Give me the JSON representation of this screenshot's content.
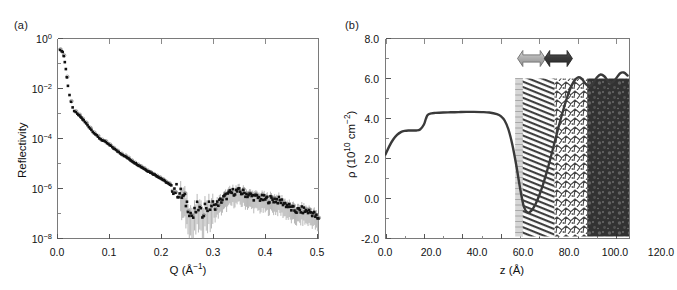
{
  "figure": {
    "panel_a_label": "(a)",
    "panel_b_label": "(b)"
  },
  "chart_data": [
    {
      "id": "panel-a",
      "type": "scatter",
      "title": "",
      "panel": "(a)",
      "xlabel": "Q (Å⁻¹)",
      "ylabel": "Reflectivity",
      "xlim": [
        0.0,
        0.5
      ],
      "ylim": [
        1e-08,
        3.0
      ],
      "yscale": "log",
      "xscale": "linear",
      "grid": false,
      "legend": "none",
      "xticks": [
        "0.0",
        "0.1",
        "0.2",
        "0.3",
        "0.4",
        "0.5"
      ],
      "xtick_values": [
        0.0,
        0.1,
        0.2,
        0.3,
        0.4,
        0.5
      ],
      "yticks": [
        "10⁰",
        "10⁻²",
        "10⁻⁴",
        "10⁻⁶",
        "10⁻⁸"
      ],
      "ytick_values": [
        1.0,
        0.01,
        0.0001,
        1e-06,
        1e-08
      ],
      "series": [
        {
          "name": "measured reflectivity",
          "marker": "filled-square",
          "color": "#111111",
          "errorbars": true,
          "x": [
            0.005,
            0.008,
            0.01,
            0.012,
            0.014,
            0.016,
            0.018,
            0.02,
            0.023,
            0.026,
            0.029,
            0.032,
            0.035,
            0.038,
            0.042,
            0.046,
            0.05,
            0.055,
            0.06,
            0.065,
            0.07,
            0.075,
            0.08,
            0.085,
            0.09,
            0.095,
            0.1,
            0.105,
            0.11,
            0.115,
            0.12,
            0.125,
            0.13,
            0.14,
            0.15,
            0.16,
            0.17,
            0.18,
            0.19,
            0.2,
            0.21,
            0.22,
            0.23,
            0.24,
            0.25,
            0.255,
            0.26,
            0.265,
            0.27,
            0.275,
            0.28,
            0.285,
            0.29,
            0.295,
            0.3,
            0.31,
            0.32,
            0.33,
            0.34,
            0.35,
            0.36,
            0.37,
            0.38,
            0.39,
            0.4,
            0.41,
            0.42,
            0.43,
            0.44,
            0.45,
            0.46,
            0.47,
            0.48,
            0.49,
            0.5
          ],
          "y": [
            0.95,
            0.9,
            0.8,
            0.55,
            0.3,
            0.15,
            0.07,
            0.03,
            0.012,
            0.006,
            0.0035,
            0.0026,
            0.0022,
            0.0019,
            0.0016,
            0.0013,
            0.001,
            0.00075,
            0.00055,
            0.0004,
            0.0003,
            0.00023,
            0.00018,
            0.00015,
            0.00013,
            0.00011,
            9e-05,
            7.5e-05,
            6e-05,
            5e-05,
            4.2e-05,
            3.5e-05,
            3e-05,
            2.1e-05,
            1.5e-05,
            1.1e-05,
            8e-06,
            6e-06,
            4.5e-06,
            3.3e-06,
            2.3e-06,
            1.6e-06,
            1e-06,
            6e-07,
            2.5e-07,
            1.2e-07,
            8e-08,
            1.5e-07,
            2.2e-07,
            1e-07,
            1.8e-07,
            2.5e-07,
            2e-07,
            2.6e-07,
            2.2e-07,
            3.5e-07,
            5.5e-07,
            8e-07,
            1e-06,
            9.5e-07,
            8e-07,
            6.5e-07,
            5.5e-07,
            5e-07,
            4.6e-07,
            4.6e-07,
            4.4e-07,
            3.6e-07,
            2.6e-07,
            1.7e-07,
            1.5e-07,
            1.6e-07,
            1.4e-07,
            1.2e-07,
            6e-08
          ]
        },
        {
          "name": "open-circle data / fit overlay",
          "marker": "open-circle",
          "color": "#8c8c8c",
          "errorbars": false
        }
      ],
      "annotations": []
    },
    {
      "id": "panel-b",
      "type": "line",
      "title": "",
      "panel": "(b)",
      "xlabel": "z (Å)",
      "ylabel": "ρ (10¹⁰ cm⁻²)",
      "xlim": [
        0.0,
        127.0
      ],
      "ylim": [
        -2.0,
        8.0
      ],
      "yscale": "linear",
      "xscale": "linear",
      "grid": false,
      "legend": "none",
      "xticks": [
        "0.0",
        "20.0",
        "40.0",
        "60.0",
        "80.0",
        "100.0",
        "120.0"
      ],
      "xtick_values": [
        0,
        20,
        40,
        60,
        80,
        100,
        120
      ],
      "yticks": [
        "8.0",
        "6.0",
        "4.0",
        "2.0",
        "0.0",
        "-2.0"
      ],
      "ytick_values": [
        8.0,
        6.0,
        4.0,
        2.0,
        0.0,
        -2.0
      ],
      "series": [
        {
          "name": "scattering length density profile",
          "color": "#3a3a3a",
          "x": [
            0,
            2,
            4,
            6,
            8,
            10,
            12,
            14,
            16,
            18,
            20,
            21,
            22,
            24,
            26,
            30,
            34,
            38,
            42,
            46,
            50,
            54,
            58,
            60,
            62,
            64,
            66,
            68,
            70,
            72,
            74,
            76,
            78,
            80,
            82,
            84,
            86,
            88,
            90,
            92,
            94,
            96,
            98,
            100,
            102,
            104,
            106,
            108,
            110,
            112,
            114,
            116,
            118,
            120,
            122,
            124,
            126
          ],
          "y": [
            2.2,
            2.62,
            2.95,
            3.18,
            3.32,
            3.38,
            3.4,
            3.4,
            3.4,
            3.45,
            3.7,
            3.98,
            4.18,
            4.26,
            4.28,
            4.3,
            4.31,
            4.32,
            4.33,
            4.33,
            4.32,
            4.3,
            4.22,
            4.12,
            3.9,
            3.45,
            2.7,
            1.7,
            0.55,
            -0.4,
            -0.7,
            -0.6,
            -0.3,
            0.15,
            0.7,
            1.35,
            2.05,
            2.8,
            3.55,
            4.25,
            4.9,
            5.45,
            5.85,
            6.05,
            6.0,
            5.75,
            5.6,
            5.75,
            6.05,
            6.2,
            6.1,
            5.85,
            5.8,
            6.0,
            6.25,
            6.3,
            6.15
          ]
        }
      ],
      "annotations": [
        {
          "name": "left-double-arrow",
          "color": "#b3b3b3",
          "x_center": 76,
          "y_center": 7.0
        },
        {
          "name": "right-double-arrow",
          "color": "#3d3d3d",
          "x_center": 90,
          "y_center": 7.0
        }
      ],
      "overlay": {
        "name": "molecular-dynamics-snapshot",
        "description": "MD simulation snapshot overlaid on the right portion of the profile: alkyl chain region, interfacial water region and bulk water with ions",
        "x_start": 68,
        "x_end": 127,
        "y_top": 6.0,
        "y_bottom": -1.9
      }
    }
  ]
}
